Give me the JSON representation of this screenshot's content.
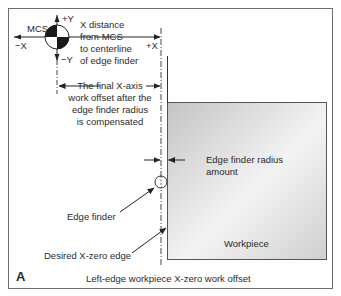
{
  "figure": {
    "panel_letter": "A",
    "caption": "Left-edge workpiece X-zero work offset"
  },
  "axes": {
    "mcs_label": "MCS",
    "plus_y": "+Y",
    "minus_y": "−Y",
    "minus_x": "−X",
    "plus_x": "+X"
  },
  "annotations": {
    "x_distance": [
      "X distance",
      "from MCS",
      "to centerline",
      "of edge finder"
    ],
    "final_offset": [
      "The final X-axis",
      "work offset after the",
      "edge finder radius",
      "is compensated"
    ],
    "radius_amount": [
      "Edge finder radius",
      "amount"
    ],
    "edge_finder": "Edge finder",
    "desired_edge": "Desired X-zero edge",
    "workpiece": "Workpiece"
  },
  "colors": {
    "frame": "#6e6e6e",
    "line": "#333333",
    "workpiece_fill_light": "#f2f2f2",
    "workpiece_fill_dark": "#c9c9c9",
    "symbol_dark": "#1a1a1a"
  }
}
